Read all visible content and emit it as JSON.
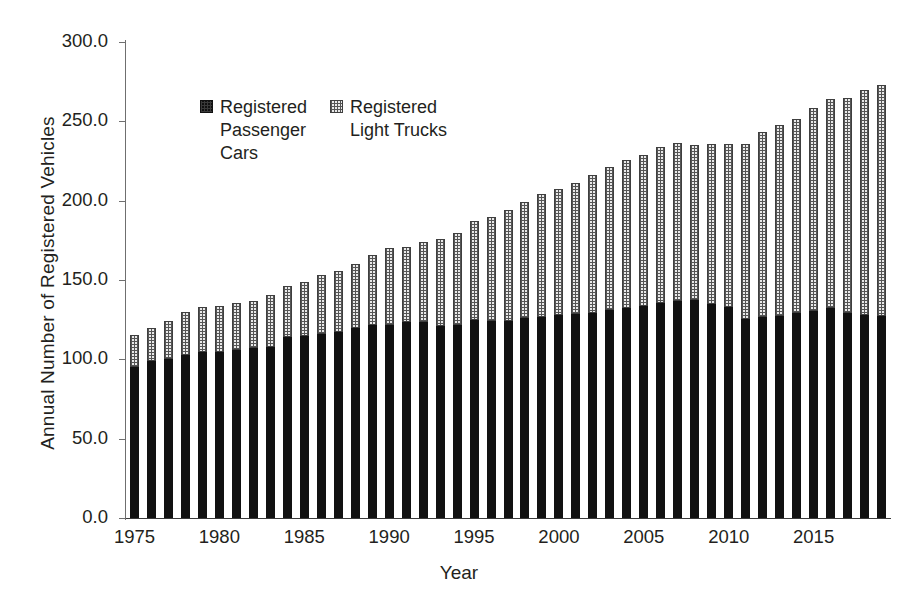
{
  "chart_data": {
    "type": "bar",
    "subtype": "stacked-vertical",
    "title": "",
    "xlabel": "Year",
    "ylabel": "Annual Number of Registered Vehicles",
    "ylim": [
      0,
      300
    ],
    "ytick_step": 50,
    "ytick_labels": [
      "300.0",
      "250.0",
      "200.0",
      "150.0",
      "100.0",
      "50.0",
      "0.0"
    ],
    "ytick_values": [
      300,
      250,
      200,
      150,
      100,
      50,
      0
    ],
    "xtick_labels": [
      "1975",
      "1980",
      "1985",
      "1990",
      "1995",
      "2000",
      "2005",
      "2010",
      "2015"
    ],
    "xtick_values": [
      1975,
      1980,
      1985,
      1990,
      1995,
      2000,
      2005,
      2010,
      2015
    ],
    "grid": false,
    "legend_position": "inside-upper-left",
    "categories": [
      1975,
      1976,
      1977,
      1978,
      1979,
      1980,
      1981,
      1982,
      1983,
      1984,
      1985,
      1986,
      1987,
      1988,
      1989,
      1990,
      1991,
      1992,
      1993,
      1994,
      1995,
      1996,
      1997,
      1998,
      1999,
      2000,
      2001,
      2002,
      2003,
      2004,
      2005,
      2006,
      2007,
      2008,
      2009,
      2010,
      2011,
      2012,
      2013,
      2014,
      2015,
      2016,
      2017,
      2018,
      2019
    ],
    "series": [
      {
        "name": "Registered Passenger Cars",
        "fill": "solid-black",
        "color": "#111111",
        "values": [
          95.2,
          98.9,
          100.4,
          102.9,
          104.7,
          104.6,
          105.8,
          106.9,
          108.0,
          114.0,
          114.7,
          115.8,
          117.3,
          119.5,
          121.5,
          121.8,
          123.3,
          123.4,
          121.1,
          121.7,
          124.7,
          124.0,
          124.1,
          125.8,
          126.9,
          127.7,
          128.5,
          129.5,
          130.8,
          132.3,
          133.6,
          135.4,
          136.7,
          137.1,
          134.9,
          133.0,
          125.7,
          126.4,
          127.6,
          129.0,
          130.2,
          132.1,
          129.0,
          128.1,
          127.5
        ]
      },
      {
        "name": "Registered Light Trucks",
        "fill": "dotted-hatch",
        "color": "#e9e9e9",
        "values": [
          20.2,
          21.0,
          24.0,
          26.7,
          28.4,
          29.2,
          29.9,
          30.1,
          32.5,
          32.0,
          34.0,
          37.1,
          38.3,
          40.8,
          44.0,
          48.3,
          47.6,
          50.6,
          54.5,
          58.2,
          62.6,
          65.6,
          70.0,
          73.2,
          77.4,
          79.6,
          82.8,
          86.9,
          90.7,
          93.2,
          95.5,
          98.2,
          99.9,
          98.0,
          101.0,
          102.5,
          110.0,
          117.2,
          120.4,
          122.5,
          128.0,
          132.0,
          136.0,
          141.5,
          145.5
        ]
      }
    ]
  },
  "axis": {
    "y_title": "Annual Number of Registered Vehicles",
    "x_title": "Year"
  },
  "legend": {
    "items": [
      {
        "label": "Registered\nPassenger\nCars",
        "swatch": "solid-black-square-icon"
      },
      {
        "label": "Registered\nLight Trucks",
        "swatch": "dotted-square-icon"
      }
    ]
  }
}
